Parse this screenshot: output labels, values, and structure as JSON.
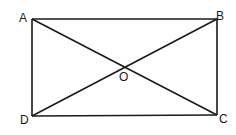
{
  "diagram": {
    "type": "rectangle-with-diagonals",
    "points": {
      "A": {
        "label": "A",
        "x": 32,
        "y": 19
      },
      "B": {
        "label": "B",
        "x": 217,
        "y": 19
      },
      "C": {
        "label": "C",
        "x": 217,
        "y": 115
      },
      "D": {
        "label": "D",
        "x": 32,
        "y": 116
      },
      "O": {
        "label": "O",
        "x": 124,
        "y": 67
      }
    },
    "segments": [
      "AB",
      "BC",
      "CD",
      "DA",
      "AC",
      "BD"
    ],
    "stroke_color": "#1a1a1a"
  }
}
